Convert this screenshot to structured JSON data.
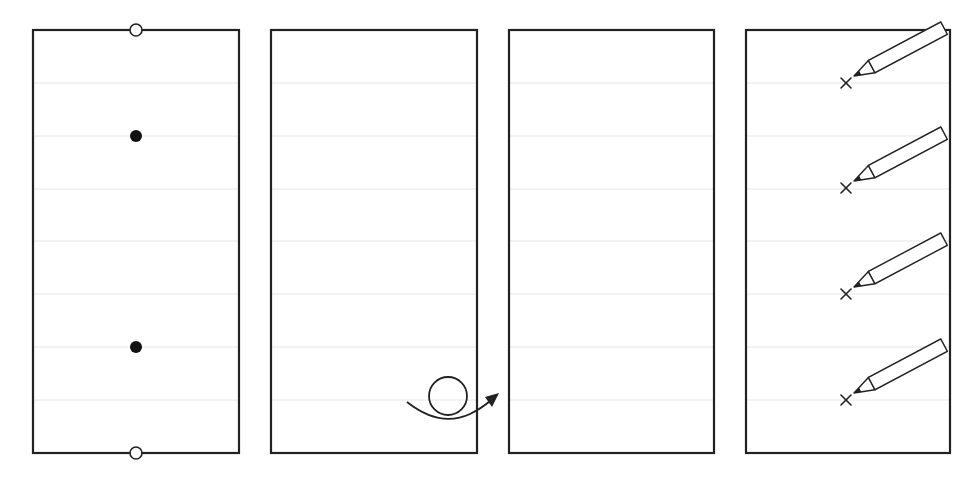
{
  "diagram": {
    "title": "Four-step paper marking instructions",
    "colors": {
      "stroke": "#222222",
      "guide": "#e6e6e6",
      "background": "#ffffff"
    },
    "guide_lines_y": [
      83,
      136,
      189,
      241,
      294,
      347,
      400
    ],
    "panels": [
      {
        "step": 1,
        "label": "Step 1: sheet with top and bottom edge holes and two filled dots",
        "rect": {
          "x": 33,
          "y": 30,
          "w": 206,
          "h": 423
        },
        "hollow_circles": [
          {
            "cx": 136,
            "cy": 30
          },
          {
            "cx": 136,
            "cy": 453
          }
        ],
        "filled_dots": [
          {
            "cx": 136,
            "cy": 136
          },
          {
            "cx": 136,
            "cy": 347
          }
        ]
      },
      {
        "step": 2,
        "label": "Step 2: roll / loop the sheet forward",
        "rect": {
          "x": 271,
          "y": 30,
          "w": 206,
          "h": 423
        },
        "curl_arrow": {
          "loop_cx": 448,
          "loop_cy": 396,
          "loop_r": 19,
          "direction": "right"
        }
      },
      {
        "step": 3,
        "label": "Step 3: blank sheet",
        "rect": {
          "x": 509,
          "y": 30,
          "w": 205,
          "h": 423
        }
      },
      {
        "step": 4,
        "label": "Step 4: mark X at four positions with a pencil",
        "rect": {
          "x": 746,
          "y": 30,
          "w": 204,
          "h": 423
        },
        "x_marks": [
          {
            "x": 846,
            "y": 83
          },
          {
            "x": 846,
            "y": 188
          },
          {
            "x": 846,
            "y": 294
          },
          {
            "x": 846,
            "y": 400
          }
        ],
        "icon": "pencil-icon"
      }
    ]
  }
}
